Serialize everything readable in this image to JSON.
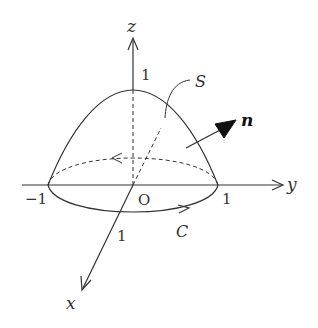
{
  "diagram": {
    "axes": {
      "x_label": "x",
      "y_label": "y",
      "z_label": "z",
      "origin_label": "O"
    },
    "ticks": {
      "z_one": "1",
      "y_neg_one": "−1",
      "y_one": "1",
      "x_one": "1"
    },
    "surface_label": "S",
    "curve_label": "C",
    "normal_label": "n",
    "colors": {
      "stroke": "#333333",
      "background": "#ffffff"
    }
  }
}
